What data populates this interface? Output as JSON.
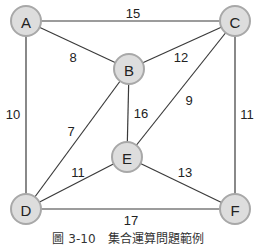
{
  "graph": {
    "nodes": [
      {
        "id": "A",
        "label": "A",
        "x": 26,
        "y": 21
      },
      {
        "id": "B",
        "label": "B",
        "x": 129,
        "y": 69
      },
      {
        "id": "C",
        "label": "C",
        "x": 235,
        "y": 21
      },
      {
        "id": "D",
        "label": "D",
        "x": 26,
        "y": 209
      },
      {
        "id": "E",
        "label": "E",
        "x": 127,
        "y": 157
      },
      {
        "id": "F",
        "label": "F",
        "x": 235,
        "y": 209
      }
    ],
    "edges": [
      {
        "from": "A",
        "to": "C",
        "weight": "15",
        "lx": 133,
        "ly": 13
      },
      {
        "from": "A",
        "to": "B",
        "weight": "8",
        "lx": 73,
        "ly": 57
      },
      {
        "from": "A",
        "to": "D",
        "weight": "10",
        "lx": 13,
        "ly": 114
      },
      {
        "from": "B",
        "to": "C",
        "weight": "12",
        "lx": 181,
        "ly": 57
      },
      {
        "from": "B",
        "to": "E",
        "weight": "16",
        "lx": 141,
        "ly": 113
      },
      {
        "from": "B",
        "to": "D",
        "weight": "7",
        "lx": 71,
        "ly": 131
      },
      {
        "from": "C",
        "to": "E",
        "weight": "9",
        "lx": 189,
        "ly": 100
      },
      {
        "from": "C",
        "to": "F",
        "weight": "11",
        "lx": 247,
        "ly": 114
      },
      {
        "from": "D",
        "to": "E",
        "weight": "11",
        "lx": 78,
        "ly": 172
      },
      {
        "from": "E",
        "to": "F",
        "weight": "13",
        "lx": 185,
        "ly": 172
      },
      {
        "from": "D",
        "to": "F",
        "weight": "17",
        "lx": 131,
        "ly": 220
      }
    ]
  },
  "caption": "圖 3-10　集合運算問題範例",
  "colors": {
    "node_fill": "#dddddd",
    "node_stroke": "#a8a8a8",
    "edge": "#3a3a3a"
  }
}
